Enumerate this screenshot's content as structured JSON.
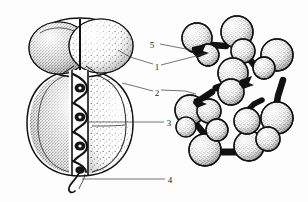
{
  "figure": {
    "background_color": "#fdfdfd",
    "ink_color": "#111111",
    "leader_line_color": "#3a3a3a",
    "style": "scanned halftone / stipple engraving"
  },
  "panels": [
    {
      "id": "left-panel",
      "name": "ovoid-cell-sectional-view",
      "description": "Ovoid cell shown in cut-away section with an upper cap lobe, a larger lower body lobe, a central coiled helical filament, and a short curled tail at the base"
    },
    {
      "id": "right-panel",
      "name": "sphere-chain-model",
      "description": "Beaded chain model built from stippled spheres joined by thick dark connectors, looping back on itself"
    }
  ],
  "labels": [
    {
      "id": "label-1",
      "text": "1",
      "x": 156,
      "y": 67,
      "target": "outer cap lobe of left cell / sphere on right chain"
    },
    {
      "id": "label-2",
      "text": "2",
      "x": 156,
      "y": 93,
      "target": "outer body wall of left cell"
    },
    {
      "id": "label-3",
      "text": "3",
      "x": 167,
      "y": 123,
      "target": "central coiled helical filament"
    },
    {
      "id": "label-4",
      "text": "4",
      "x": 168,
      "y": 180,
      "target": "curled basal tail"
    },
    {
      "id": "label-5",
      "text": "5",
      "x": 152,
      "y": 45,
      "target": "dark connector neck on sphere chain"
    }
  ],
  "leaders": [
    {
      "id": "leader-1-left",
      "from_label": "1",
      "path": "M 153 64 L 130 57 L 118 50"
    },
    {
      "id": "leader-1-right",
      "from_label": "1",
      "path": "M 161 65 L 196 56 L 206 53"
    },
    {
      "id": "leader-2-left",
      "from_label": "2",
      "path": "M 153 91 L 134 86 L 122 83"
    },
    {
      "id": "leader-2-right",
      "from_label": "2",
      "path": "M 161 90 L 185 91 L 196 94"
    },
    {
      "id": "leader-3",
      "from_label": "3",
      "path": "M 164 122 L 88 122"
    },
    {
      "id": "leader-4",
      "from_label": "4",
      "path": "M 165 179 L 82 179"
    },
    {
      "id": "leader-5",
      "from_label": "5",
      "path": "M 160 44 L 186 49 L 194 51"
    }
  ],
  "annotations": {
    "label_count": 5,
    "panel_count": 2
  }
}
